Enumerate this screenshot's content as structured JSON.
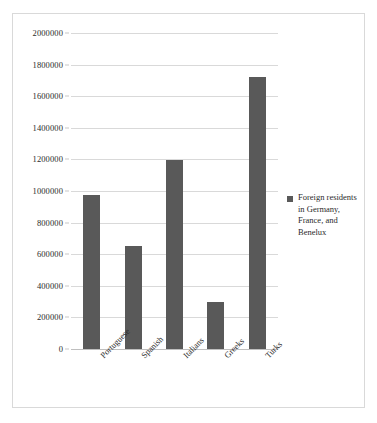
{
  "chart_data": {
    "type": "bar",
    "title": "",
    "subtitle": "",
    "xlabel": "",
    "ylabel": "",
    "categories": [
      "Portuguese",
      "Spanish",
      "Italians",
      "Greeks",
      "Turks"
    ],
    "series": [
      {
        "name": "Foreign residents in Germany, France, and Benelux",
        "values": [
          975000,
          655000,
          1197000,
          300000,
          1720000
        ]
      }
    ],
    "ylim": [
      0,
      2000000
    ],
    "ytick_values": [
      0,
      200000,
      400000,
      600000,
      800000,
      1000000,
      1200000,
      1400000,
      1600000,
      1800000,
      2000000
    ],
    "ytick_labels": [
      "0",
      "200000",
      "400000",
      "600000",
      "800000",
      "1000000",
      "1200000",
      "1400000",
      "1600000",
      "1800000",
      "2000000"
    ],
    "grid": true,
    "grid_axis": "y",
    "legend": {
      "position": "right",
      "entries": [
        {
          "label": "Foreign residents in Germany, France, and Benelux",
          "marker": "square",
          "color": "#595959"
        }
      ]
    },
    "bar_color": "#595959",
    "xtick_rotation": -45,
    "colors": {
      "bar": "#595959",
      "gridline": "#d9d9d9",
      "axis": "#bfbfbf",
      "text": "#2b2b2b",
      "border": "#d9d9d9",
      "background": "#ffffff"
    }
  }
}
